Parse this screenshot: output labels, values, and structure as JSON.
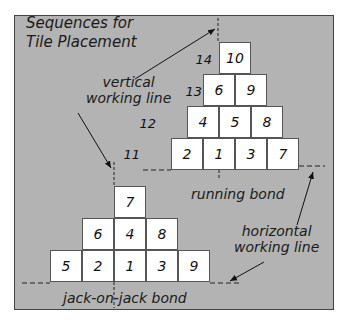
{
  "title": [
    "Sequences for",
    "Tile Placement"
  ],
  "labels": {
    "vertical": [
      "vertical",
      "working line"
    ],
    "horizontal": [
      "horizontal",
      "working line"
    ],
    "running_bond": "running bond",
    "jack_on_jack": "jack-on-jack bond"
  },
  "running_bond": {
    "row_numbers": [
      "11",
      "12",
      "13",
      "14"
    ],
    "rows": [
      [
        "2",
        "1",
        "3",
        "7"
      ],
      [
        "4",
        "5",
        "8"
      ],
      [
        "6",
        "9"
      ],
      [
        "10"
      ]
    ]
  },
  "jack_on_jack_bond": {
    "rows": [
      [
        "5",
        "2",
        "1",
        "3",
        "9"
      ],
      [
        "6",
        "4",
        "8"
      ],
      [
        "7"
      ]
    ]
  },
  "colors": {
    "background": "#b3b3b3",
    "tile": "#ffffff",
    "ink": "#1a1a1a"
  }
}
